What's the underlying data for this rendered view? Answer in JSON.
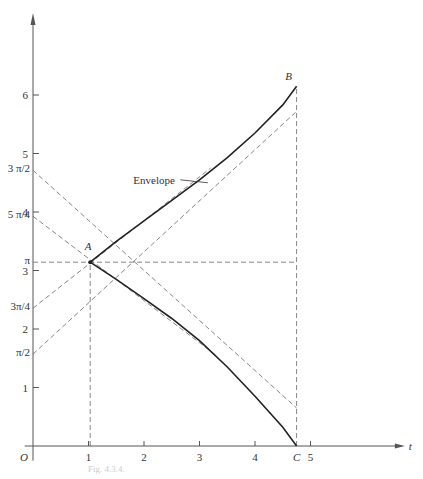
{
  "chart_data": {
    "type": "line",
    "title": "",
    "caption": "Fig. 4.3.4.",
    "xlabel": "t",
    "ylabel": "",
    "origin_label": "O",
    "xlim": [
      0,
      6.7
    ],
    "ylim": [
      0,
      7.4
    ],
    "x_ticks": [
      {
        "value": 1,
        "label": "1"
      },
      {
        "value": 2,
        "label": "2"
      },
      {
        "value": 3,
        "label": "3"
      },
      {
        "value": 4,
        "label": "4"
      },
      {
        "value": 5,
        "label": "5"
      }
    ],
    "y_ticks": [
      {
        "value": 1,
        "label": "1"
      },
      {
        "value": 2,
        "label": "2"
      },
      {
        "value": 3,
        "label": "3"
      },
      {
        "value": 4,
        "label": "4"
      },
      {
        "value": 5,
        "label": "5"
      },
      {
        "value": 6,
        "label": "6"
      }
    ],
    "y_special_ticks": [
      {
        "value": 1.5708,
        "label": "π/2"
      },
      {
        "value": 2.3562,
        "label": "3π/4"
      },
      {
        "value": 3.1416,
        "label": "π"
      },
      {
        "value": 3.927,
        "label": "5 π/4"
      },
      {
        "value": 4.7124,
        "label": "3 π/2"
      }
    ],
    "points": [
      {
        "name": "A",
        "x": 1.03,
        "y": 3.1416
      },
      {
        "name": "B",
        "x": 4.75,
        "y": 6.15
      },
      {
        "name": "C",
        "x": 4.75,
        "y": 0
      }
    ],
    "annotations": [
      {
        "text": "Envelope",
        "x": 2.6,
        "y": 4.55,
        "points_to": {
          "x": 3.15,
          "y": 4.5
        }
      }
    ],
    "series": [
      {
        "name": "upper envelope",
        "style": "solid",
        "x": [
          1.03,
          1.5,
          2.0,
          2.5,
          3.0,
          3.5,
          4.0,
          4.5,
          4.75
        ],
        "y": [
          3.1416,
          3.5,
          3.85,
          4.2,
          4.55,
          4.93,
          5.35,
          5.83,
          6.15
        ]
      },
      {
        "name": "lower envelope",
        "style": "solid",
        "x": [
          1.03,
          1.5,
          2.0,
          2.5,
          3.0,
          3.5,
          4.0,
          4.5,
          4.75
        ],
        "y": [
          3.1416,
          2.85,
          2.52,
          2.18,
          1.8,
          1.35,
          0.85,
          0.32,
          0.0
        ]
      },
      {
        "name": "tangent from π/2",
        "style": "dashed",
        "x": [
          0,
          4.75
        ],
        "y": [
          1.5708,
          5.72
        ]
      },
      {
        "name": "tangent from 3π/4",
        "style": "dashed",
        "x": [
          0,
          3.2
        ],
        "y": [
          2.3562,
          4.75
        ]
      },
      {
        "name": "tangent from 5π/4",
        "style": "dashed",
        "x": [
          0,
          3.3
        ],
        "y": [
          3.927,
          1.55
        ]
      },
      {
        "name": "tangent from 3π/2",
        "style": "dashed",
        "x": [
          0,
          4.75
        ],
        "y": [
          4.7124,
          0.65
        ]
      },
      {
        "name": "horizontal y=π",
        "style": "dashed",
        "x": [
          0,
          4.75
        ],
        "y": [
          3.1416,
          3.1416
        ]
      },
      {
        "name": "vertical t=1",
        "style": "dashed",
        "x": [
          1.03,
          1.03
        ],
        "y": [
          0,
          3.1416
        ]
      },
      {
        "name": "vertical t=C",
        "style": "dashed",
        "x": [
          4.75,
          4.75
        ],
        "y": [
          0,
          6.15
        ]
      }
    ]
  }
}
